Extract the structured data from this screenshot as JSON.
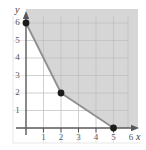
{
  "figure": {
    "width": 146,
    "height": 150,
    "background_color": "#ffffff"
  },
  "axes": {
    "x_name": "x",
    "y_name": "y",
    "x_tick_labels": [
      "1",
      "2",
      "3",
      "4",
      "5",
      "6"
    ],
    "y_tick_labels": [
      "1",
      "2",
      "3",
      "4",
      "5",
      "6"
    ],
    "axis_color": "#58585a",
    "tick_color": "#58585a",
    "label_color": "#58585a"
  },
  "style": {
    "grid_color": "#b9b9bb",
    "shade_color": "#d6d6d6",
    "boundary_color": "#8e8e90",
    "point_color": "#1c1c1c",
    "plot_background": "#ffffff"
  },
  "chart_data": {
    "type": "line",
    "title": "",
    "xlabel": "x",
    "ylabel": "y",
    "xlim": [
      0,
      6.5
    ],
    "ylim": [
      0,
      6.8
    ],
    "grid": true,
    "legend": "none",
    "x_ticks": [
      1,
      2,
      3,
      4,
      5,
      6
    ],
    "y_ticks": [
      1,
      2,
      3,
      4,
      5,
      6
    ],
    "series": [
      {
        "name": "boundary",
        "kind": "piecewise-line",
        "x": [
          0,
          2,
          5
        ],
        "y": [
          6,
          2,
          0
        ]
      }
    ],
    "points": [
      {
        "x": 0,
        "y": 6,
        "label": "(0, 6)",
        "marker": "filled-circle"
      },
      {
        "x": 2,
        "y": 2,
        "label": "(2, 2)",
        "marker": "filled-circle"
      },
      {
        "x": 5,
        "y": 0,
        "label": "(5, 0)",
        "marker": "filled-circle"
      }
    ],
    "shaded_region": {
      "description": "feasible region above and to the right of the piecewise boundary",
      "fill": "#d6d6d6",
      "vertices": [
        [
          0,
          6
        ],
        [
          2,
          2
        ],
        [
          5,
          0
        ],
        [
          6.4,
          0
        ],
        [
          6.4,
          6.8
        ],
        [
          0,
          6.8
        ]
      ]
    },
    "annotations": []
  }
}
